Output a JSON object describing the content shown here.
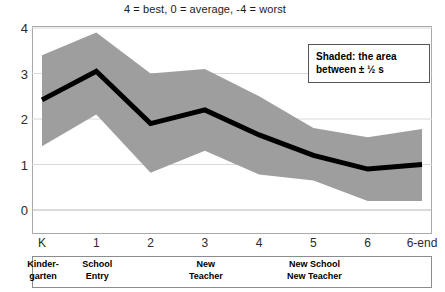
{
  "chart_data": {
    "type": "line",
    "title": "4 = best, 0 = average, -4 = worst",
    "xlabel": "",
    "ylabel": "",
    "ylim": [
      0,
      4
    ],
    "yticks": [
      0,
      1,
      2,
      3,
      4
    ],
    "grid": true,
    "legend_position": "inside-top-right",
    "categories": [
      "K",
      "1",
      "2",
      "3",
      "4",
      "5",
      "6",
      "6-end"
    ],
    "series": [
      {
        "name": "mean",
        "style": "thick-black-line",
        "color": "#000000",
        "values": [
          2.42,
          3.05,
          1.9,
          2.2,
          1.65,
          1.2,
          0.9,
          1.0
        ]
      },
      {
        "name": "upper (+ 1/2 s)",
        "style": "shaded-band-upper",
        "color": "#9e9e9e",
        "values": [
          3.4,
          3.9,
          3.0,
          3.1,
          2.5,
          1.8,
          1.6,
          1.78
        ]
      },
      {
        "name": "lower (- 1/2 s)",
        "style": "shaded-band-lower",
        "color": "#9e9e9e",
        "values": [
          1.4,
          2.1,
          0.82,
          1.3,
          0.78,
          0.65,
          0.2,
          0.2
        ]
      }
    ],
    "annotations": [
      {
        "text": "Kinder-\ngarten",
        "at_category": "K"
      },
      {
        "text": "School\nEntry",
        "at_category": "1"
      },
      {
        "text": "New\nTeacher",
        "at_category": "3"
      },
      {
        "text": "New School\nNew Teacher",
        "at_category": "5"
      }
    ]
  },
  "title": {
    "text": "4 = best, 0 = average, -4 = worst"
  },
  "legend": {
    "line1": "Shaded: the area",
    "line2": "between ±  ½ s"
  },
  "axes": {
    "y_ticks": [
      {
        "label": "4",
        "value": 4
      },
      {
        "label": "3",
        "value": 3
      },
      {
        "label": "2",
        "value": 2
      },
      {
        "label": "1",
        "value": 1
      },
      {
        "label": "0",
        "value": 0
      }
    ],
    "x_ticks": [
      {
        "label": "K"
      },
      {
        "label": "1"
      },
      {
        "label": "2"
      },
      {
        "label": "3"
      },
      {
        "label": "4"
      },
      {
        "label": "5"
      },
      {
        "label": "6"
      },
      {
        "label": "6-end"
      }
    ]
  },
  "phase_bar": {
    "items": [
      {
        "line1": "Kinder-",
        "line2": "garten",
        "at": "K"
      },
      {
        "line1": "School",
        "line2": "Entry",
        "at": "1"
      },
      {
        "line1": "New",
        "line2": "Teacher",
        "at": "3"
      },
      {
        "line1": "New School",
        "line2": "New Teacher",
        "at": "5"
      }
    ]
  },
  "colors": {
    "band": "#9e9e9e",
    "line": "#000000",
    "grid": "#d9d9d9",
    "frame": "#a9a9a9"
  }
}
